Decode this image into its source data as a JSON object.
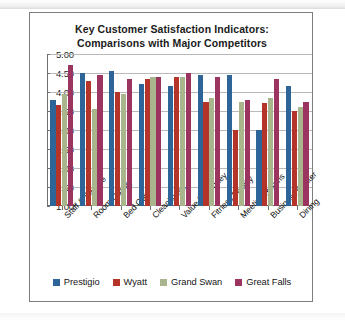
{
  "chart_data": {
    "type": "bar",
    "title": "Key Customer Satisfaction Indicators:",
    "subtitle": "Comparisons with Major Competitors",
    "xlabel": "",
    "ylabel": "",
    "ylim": [
      1.0,
      5.0
    ],
    "ytick_step": 0.5,
    "grid": true,
    "legend_position": "bottom",
    "ytick_labels": [
      "5.00",
      "4.50",
      "4.00",
      "3.50",
      "3.00",
      "2.50",
      "2.00",
      "1.50",
      "1.00"
    ],
    "ytick_values": [
      5.0,
      4.5,
      4.0,
      3.5,
      3.0,
      2.5,
      2.0,
      1.5,
      1.0
    ],
    "categories": [
      "Staff & Service",
      "Room Quality",
      "Bed Comfort",
      "Cleanliness",
      "Value for Money",
      "Fitness Facility",
      "Meeting Rooms",
      "Business Center",
      "Dining"
    ],
    "series": [
      {
        "name": "Prestigio",
        "color": "#2E6598",
        "values": [
          3.8,
          4.5,
          4.55,
          4.2,
          4.15,
          4.45,
          4.45,
          3.0,
          4.15
        ]
      },
      {
        "name": "Wyatt",
        "color": "#B5342A",
        "values": [
          3.65,
          4.3,
          4.0,
          4.35,
          4.4,
          3.75,
          3.0,
          3.7,
          3.5
        ]
      },
      {
        "name": "Grand Swan",
        "color": "#A9B58C",
        "values": [
          3.95,
          3.55,
          3.95,
          4.4,
          4.4,
          3.85,
          3.75,
          3.85,
          3.6
        ]
      },
      {
        "name": "Great Falls",
        "color": "#9B3560",
        "values": [
          4.7,
          4.45,
          4.35,
          4.4,
          4.5,
          4.4,
          3.8,
          4.35,
          3.75
        ]
      }
    ]
  }
}
